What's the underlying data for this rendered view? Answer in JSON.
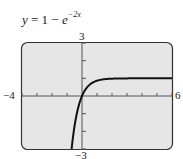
{
  "chart_data": {
    "type": "line",
    "title_parts": {
      "lhs": "y",
      "eq": " = 1 − ",
      "base": "e",
      "exp": "−2x"
    },
    "function": "y = 1 - exp(-2x)",
    "xlabel": "",
    "ylabel": "",
    "xlim": [
      -4,
      6
    ],
    "ylim": [
      -3,
      3
    ],
    "x_tick_step": 1,
    "y_tick_step": 1,
    "window_labels": {
      "xmin": "−4",
      "xmax": "6",
      "ymin": "−3",
      "ymax": "3"
    },
    "grid": false,
    "legend": null,
    "series": [
      {
        "name": "y = 1 - e^(-2x)",
        "x": [
          -0.549,
          -0.4,
          -0.3,
          -0.2,
          -0.1,
          0,
          0.25,
          0.5,
          0.75,
          1,
          1.5,
          2,
          3,
          4,
          5,
          6
        ],
        "values": [
          -2.0,
          -1.23,
          -0.82,
          -0.49,
          -0.22,
          0,
          0.39,
          0.63,
          0.78,
          0.86,
          0.95,
          0.98,
          1.0,
          1.0,
          1.0,
          1.0
        ]
      }
    ],
    "horizontal_asymptote": 1
  },
  "colors": {
    "frame_bg": "#e6e6e6",
    "frame_border": "#333333",
    "curve": "#111111",
    "axis": "#555555"
  }
}
